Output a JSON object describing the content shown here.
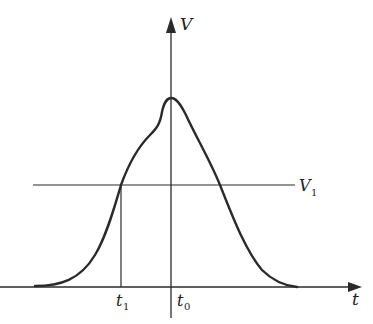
{
  "diagram": {
    "type": "pulse-waveform",
    "axes": {
      "x_label": "t",
      "y_label": "V"
    },
    "threshold": {
      "label": "V",
      "label_subscript": "1"
    },
    "markers": [
      {
        "label": "t",
        "subscript": "1"
      },
      {
        "label": "t",
        "subscript": "0"
      }
    ],
    "colors": {
      "stroke": "#2a2a2a",
      "background": "#ffffff"
    }
  }
}
